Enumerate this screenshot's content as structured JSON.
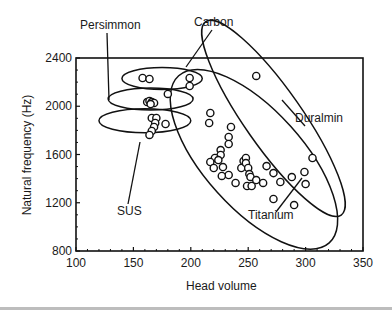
{
  "chart_data": {
    "type": "scatter",
    "title": "",
    "xlabel": "Head volume",
    "ylabel": "Natural frequency (Hz)",
    "xlim": [
      100,
      350
    ],
    "ylim": [
      800,
      2400
    ],
    "xticks": [
      100,
      150,
      200,
      250,
      300,
      350
    ],
    "yticks": [
      800,
      1200,
      1600,
      2000,
      2400
    ],
    "grid": false,
    "legend": "none",
    "series": [
      {
        "name": "Carbon",
        "points": [
          [
            158,
            2234
          ],
          [
            164,
            2226
          ],
          [
            199,
            2234
          ],
          [
            199,
            2168
          ],
          [
            180,
            2102
          ]
        ]
      },
      {
        "name": "Persimmon",
        "points": [
          [
            162,
            2035
          ],
          [
            164,
            2044
          ],
          [
            166,
            2035
          ],
          [
            168,
            2027
          ],
          [
            165,
            2018
          ]
        ]
      },
      {
        "name": "SUS",
        "points": [
          [
            166,
            1903
          ],
          [
            170,
            1903
          ],
          [
            169,
            1861
          ],
          [
            168,
            1828
          ],
          [
            166,
            1795
          ],
          [
            164,
            1762
          ],
          [
            178,
            1853
          ]
        ]
      },
      {
        "name": "Duralmin",
        "points": [
          [
            257,
            2251
          ],
          [
            306,
            1571
          ]
        ]
      },
      {
        "name": "Titanium",
        "points": [
          [
            217,
            1944
          ],
          [
            216,
            1861
          ],
          [
            235,
            1828
          ],
          [
            233,
            1745
          ],
          [
            233,
            1687
          ],
          [
            226,
            1637
          ],
          [
            226,
            1596
          ],
          [
            221,
            1571
          ],
          [
            224,
            1554
          ],
          [
            217,
            1538
          ],
          [
            220,
            1488
          ],
          [
            228,
            1496
          ],
          [
            233,
            1430
          ],
          [
            227,
            1422
          ],
          [
            239,
            1364
          ],
          [
            244,
            1488
          ],
          [
            246,
            1546
          ],
          [
            248,
            1571
          ],
          [
            248,
            1529
          ],
          [
            250,
            1488
          ],
          [
            251,
            1438
          ],
          [
            252,
            1414
          ],
          [
            249,
            1339
          ],
          [
            253,
            1339
          ],
          [
            257,
            1388
          ],
          [
            263,
            1364
          ],
          [
            266,
            1504
          ],
          [
            272,
            1446
          ],
          [
            278,
            1372
          ],
          [
            272,
            1231
          ],
          [
            288,
            1413
          ],
          [
            299,
            1455
          ],
          [
            300,
            1355
          ],
          [
            290,
            1181
          ]
        ]
      }
    ],
    "annotations": [
      {
        "text": "Persimmon",
        "group": "Persimmon"
      },
      {
        "text": "Carbon",
        "group": "Carbon"
      },
      {
        "text": "Duralmin",
        "group": "Duralmin"
      },
      {
        "text": "SUS",
        "group": "SUS"
      },
      {
        "text": "Titanium",
        "group": "Titanium"
      }
    ],
    "groupings": [
      {
        "name": "Carbon",
        "center": [
          175,
          2230
        ],
        "rx": 35,
        "ry": 110,
        "angle": 0
      },
      {
        "name": "Persimmon",
        "center": [
          165,
          2060
        ],
        "rx": 37,
        "ry": 120,
        "angle": 0
      },
      {
        "name": "SUS",
        "center": [
          160,
          1880
        ],
        "rx": 40,
        "ry": 120,
        "angle": 0
      },
      {
        "name": "Duralmin",
        "center": [
          272,
          1900
        ],
        "rx": 105,
        "ry": 25,
        "angle": 55
      },
      {
        "name": "Titanium",
        "center": [
          255,
          1560
        ],
        "rx": 100,
        "ry": 43,
        "angle": 48
      }
    ]
  }
}
